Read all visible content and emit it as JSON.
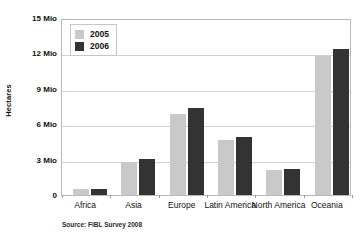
{
  "chart_data": {
    "type": "bar",
    "title": "",
    "subtitle": "",
    "xlabel": "",
    "ylabel": "Hectares",
    "categories": [
      "Africa",
      "Asia",
      "Europe",
      "Latin America",
      "North America",
      "Oceania"
    ],
    "series": [
      {
        "name": "2005",
        "color": "#c9c9c9",
        "values": [
          0.5,
          2.8,
          6.9,
          4.7,
          2.1,
          11.8
        ]
      },
      {
        "name": "2006",
        "color": "#333333",
        "values": [
          0.55,
          3.05,
          7.4,
          4.9,
          2.2,
          12.4
        ]
      }
    ],
    "ylim": [
      0,
      15
    ],
    "y_ticks": [
      0,
      3,
      6,
      9,
      12,
      15
    ],
    "y_tick_labels": [
      "0",
      "3 Mio",
      "6 Mio",
      "9 Mio",
      "12 Mio",
      "15 Mio"
    ],
    "grid": true,
    "legend_position": "top-left",
    "annotations": [
      "Source: FiBL Survey 2008"
    ]
  },
  "legend": {
    "items": [
      {
        "label": "2005"
      },
      {
        "label": "2006"
      }
    ]
  },
  "source": {
    "text": "Source: FiBL Survey 2008"
  }
}
